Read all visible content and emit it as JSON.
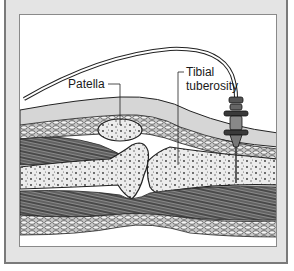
{
  "figure": {
    "type": "anatomical-illustration",
    "labels": {
      "patella": "Patella",
      "tibial_tuberosity_line1": "Tibial",
      "tibial_tuberosity_line2": "tuberosity"
    },
    "colors": {
      "frame_border": "#7a7a7a",
      "mat": "#e4e4e4",
      "panel_bg": "#ffffff",
      "bone_fill": "#e8e8e8",
      "tissue_fill": "#d0d0d0",
      "muscle_dark": "#3a3a3a",
      "ink": "#1a1a1a"
    }
  }
}
